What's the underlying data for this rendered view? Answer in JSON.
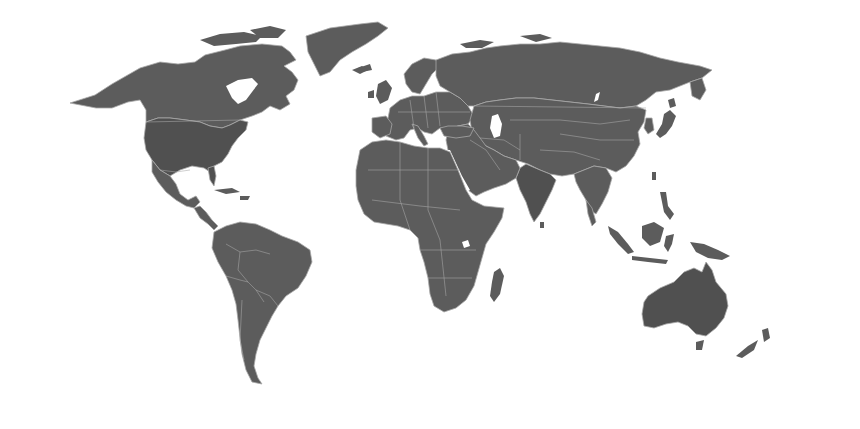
{
  "map": {
    "type": "world-political-outline",
    "projection": "compromise (Robinson-like)",
    "labels": [],
    "colors": {
      "background": "#ffffff",
      "land": "#5c5c5c",
      "land_dark": "#505050",
      "border": "#a8a8a8"
    },
    "regions": [
      {
        "name": "North America"
      },
      {
        "name": "Greenland"
      },
      {
        "name": "Central America & Caribbean"
      },
      {
        "name": "South America"
      },
      {
        "name": "Europe"
      },
      {
        "name": "Africa"
      },
      {
        "name": "Middle East"
      },
      {
        "name": "Asia"
      },
      {
        "name": "Southeast Asia & Indonesia"
      },
      {
        "name": "Australia"
      },
      {
        "name": "New Zealand"
      },
      {
        "name": "Madagascar"
      },
      {
        "name": "Japan"
      }
    ]
  }
}
